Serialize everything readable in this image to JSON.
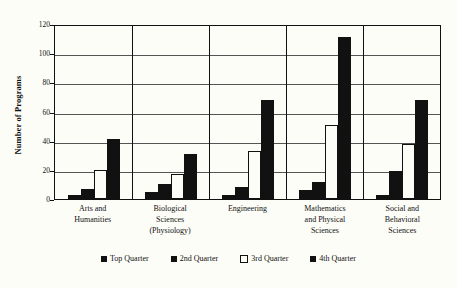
{
  "chart_data": {
    "type": "bar",
    "title": "",
    "xlabel": "",
    "ylabel": "Number of Programs",
    "ylim": [
      0,
      120
    ],
    "yticks": [
      0,
      20,
      40,
      60,
      80,
      100,
      120
    ],
    "grid": true,
    "legend_position": "bottom",
    "categories": [
      "Arts and Humanities",
      "Biological Sciences (Physiology)",
      "Engineering",
      "Mathematics and Physical Sciences",
      "Social and Behavioral Sciences"
    ],
    "category_lines": [
      [
        "Arts and",
        "Humanities"
      ],
      [
        "Biological",
        "Sciences",
        "(Physiology)"
      ],
      [
        "Engineering"
      ],
      [
        "Mathematics",
        "and Physical",
        "Sciences"
      ],
      [
        "Social and",
        "Behavioral",
        "Sciences"
      ]
    ],
    "series": [
      {
        "name": "Top Quarter",
        "style": "solid",
        "values": [
          3,
          5,
          3,
          6,
          3
        ]
      },
      {
        "name": "2nd Quarter",
        "style": "solid",
        "values": [
          7,
          10,
          8,
          12,
          19
        ]
      },
      {
        "name": "3rd Quarter",
        "style": "hollow",
        "values": [
          20,
          17,
          33,
          51,
          38
        ]
      },
      {
        "name": "4th Quarter",
        "style": "solid",
        "values": [
          41,
          31,
          68,
          111,
          68
        ]
      }
    ]
  },
  "colors": {
    "ink": "#111111",
    "paper": "#fdfdf8",
    "grid": "#555555"
  }
}
